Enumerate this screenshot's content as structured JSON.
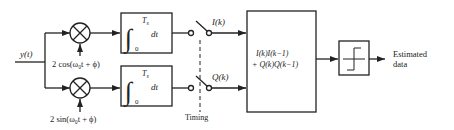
{
  "diagram": {
    "input": {
      "label": "y(t)"
    },
    "multipliers": [
      {
        "id": "top",
        "reference_label": "2 cos(ω₀t + ϕ)"
      },
      {
        "id": "bottom",
        "reference_label": "2 sin(ω₀t + ϕ)"
      }
    ],
    "integrators": [
      {
        "id": "top",
        "upper_limit": "T",
        "upper_limit_sub": "s",
        "lower_limit": "0",
        "differential": "dt"
      },
      {
        "id": "bottom",
        "upper_limit": "T",
        "upper_limit_sub": "s",
        "lower_limit": "0",
        "differential": "dt"
      }
    ],
    "switches": [
      {
        "id": "top",
        "output_label": "I(k)"
      },
      {
        "id": "bottom",
        "output_label": "Q(k)"
      }
    ],
    "timing": {
      "label": "Timing"
    },
    "combiner": {
      "line1": "I(k)I(k−1)",
      "line2": "+ Q(k)Q(k−1)"
    },
    "decision": {
      "symbol": "threshold-device"
    },
    "output": {
      "line1": "Estimated",
      "line2": "data"
    },
    "colors": {
      "stroke": "#222222",
      "background": "#ffffff"
    }
  }
}
